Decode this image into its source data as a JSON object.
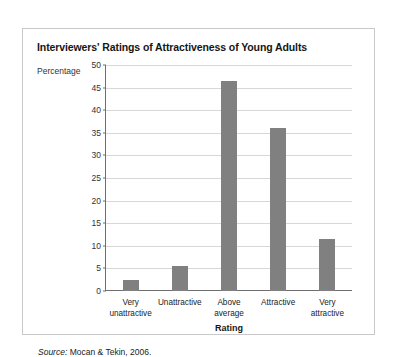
{
  "card": {
    "title": "Interviewers' Ratings of Attractiveness of Young Adults",
    "source_label": "Source:",
    "source_text": " Mocan & Tekin, 2006."
  },
  "colors": {
    "bar_fill": "#808080",
    "gridline": "#d8d8d8",
    "axis": "#6f6f6f",
    "card_border": "#c9c9cc",
    "text": "#161616"
  },
  "chart_data": {
    "type": "bar",
    "title": "Interviewers' Ratings of Attractiveness of Young Adults",
    "xlabel": "Rating",
    "ylabel": "Percentage",
    "categories": [
      "Very\nunattractive",
      "Unattractive",
      "Above\naverage",
      "Attractive",
      "Very\nattractive"
    ],
    "category_lines": [
      [
        "Very",
        "unattractive"
      ],
      [
        "Unattractive",
        ""
      ],
      [
        "Above",
        "average"
      ],
      [
        "Attractive",
        ""
      ],
      [
        "Very",
        "attractive"
      ]
    ],
    "values": [
      2.5,
      5.5,
      46.5,
      36,
      11.5
    ],
    "ylim": [
      0,
      50
    ],
    "yticks": [
      0,
      5,
      10,
      15,
      20,
      25,
      30,
      35,
      40,
      45,
      50
    ],
    "grid": true,
    "legend": false,
    "source": "Source: Mocan & Tekin, 2006."
  }
}
